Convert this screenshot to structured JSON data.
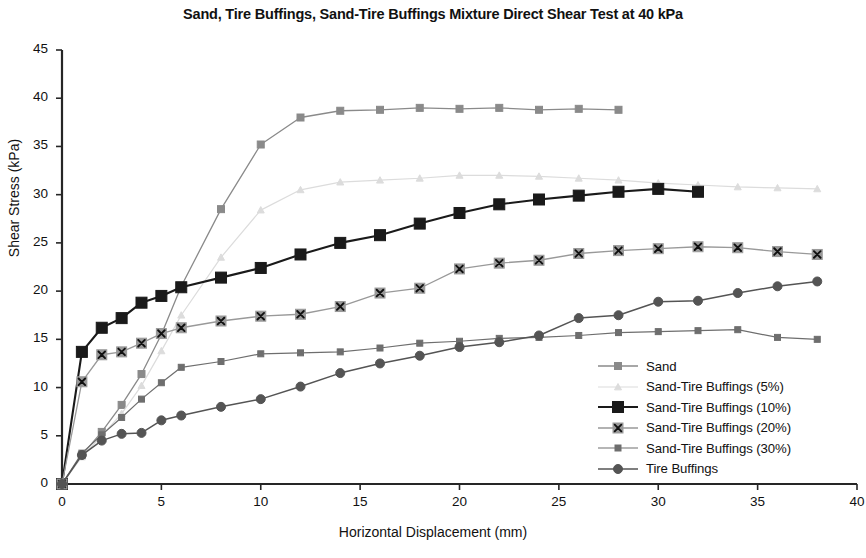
{
  "chart_data": {
    "type": "line",
    "title": "Sand, Tire Buffings, Sand-Tire Buffings Mixture Direct Shear Test at 40 kPa",
    "xlabel": "Horizontal Displacement (mm)",
    "ylabel": "Shear Stress (kPa)",
    "xlim": [
      0,
      40
    ],
    "ylim": [
      0,
      45
    ],
    "xticks": [
      0,
      5,
      10,
      15,
      20,
      25,
      30,
      35,
      40
    ],
    "yticks": [
      0,
      5,
      10,
      15,
      20,
      25,
      30,
      35,
      40,
      45
    ],
    "grid": false,
    "legend_position": "lower-right-inside",
    "series": [
      {
        "name": "Sand",
        "color": "#8a8a8a",
        "marker": "square",
        "marker_size": 7,
        "line_width": 1.3,
        "x": [
          0,
          1,
          2,
          3,
          4,
          5,
          6,
          8,
          10,
          12,
          14,
          16,
          18,
          20,
          22,
          24,
          26,
          28
        ],
        "y": [
          0,
          3.0,
          5.4,
          8.2,
          11.4,
          15.5,
          20.5,
          28.5,
          35.2,
          38.0,
          38.7,
          38.8,
          39.0,
          38.9,
          39.0,
          38.8,
          38.9,
          38.8
        ]
      },
      {
        "name": "Sand-Tire Buffings (5%)",
        "color": "#dcdcdc",
        "marker": "triangle",
        "marker_size": 7,
        "line_width": 1.2,
        "x": [
          0,
          1,
          2,
          3,
          4,
          5,
          6,
          8,
          10,
          12,
          14,
          16,
          18,
          20,
          22,
          24,
          26,
          28,
          30,
          32,
          34,
          36,
          38
        ],
        "y": [
          0,
          2.8,
          5.0,
          7.3,
          10.2,
          13.8,
          17.5,
          23.5,
          28.4,
          30.5,
          31.3,
          31.5,
          31.7,
          32.0,
          32.0,
          31.9,
          31.7,
          31.5,
          31.2,
          31.0,
          30.8,
          30.7,
          30.6
        ]
      },
      {
        "name": "Sand-Tire Buffings (10%)",
        "color": "#1a1a1a",
        "marker": "square",
        "marker_size": 11,
        "line_width": 2.1,
        "x": [
          0,
          1,
          2,
          3,
          4,
          5,
          6,
          8,
          10,
          12,
          14,
          16,
          18,
          20,
          22,
          24,
          26,
          28,
          30,
          32
        ],
        "y": [
          0,
          13.7,
          16.2,
          17.2,
          18.8,
          19.5,
          20.4,
          21.4,
          22.4,
          23.8,
          25.0,
          25.8,
          27.0,
          28.1,
          29.0,
          29.5,
          29.9,
          30.3,
          30.6,
          30.3
        ]
      },
      {
        "name": "Sand-Tire Buffings (20%)",
        "color": "#999999",
        "marker": "x-square",
        "marker_size": 10,
        "line_width": 1.3,
        "x": [
          0,
          1,
          2,
          3,
          4,
          5,
          6,
          8,
          10,
          12,
          14,
          16,
          18,
          20,
          22,
          24,
          26,
          28,
          30,
          32,
          34,
          36,
          38
        ],
        "y": [
          0,
          10.6,
          13.4,
          13.7,
          14.6,
          15.6,
          16.2,
          16.9,
          17.4,
          17.6,
          18.4,
          19.8,
          20.3,
          22.3,
          22.9,
          23.2,
          23.9,
          24.2,
          24.4,
          24.6,
          24.5,
          24.1,
          23.8
        ]
      },
      {
        "name": "Sand-Tire Buffings (30%)",
        "color": "#6e6e6e",
        "marker": "square",
        "marker_size": 6,
        "line_width": 1.2,
        "x": [
          0,
          1,
          2,
          3,
          4,
          5,
          6,
          8,
          10,
          12,
          14,
          16,
          18,
          20,
          22,
          24,
          26,
          28,
          30,
          32,
          34,
          36,
          38
        ],
        "y": [
          0,
          3.2,
          5.1,
          6.9,
          8.8,
          10.5,
          12.1,
          12.7,
          13.5,
          13.6,
          13.7,
          14.1,
          14.6,
          14.8,
          15.1,
          15.2,
          15.4,
          15.7,
          15.8,
          15.9,
          16.0,
          15.2,
          15.0
        ]
      },
      {
        "name": "Tire Buffings",
        "color": "#545454",
        "marker": "circle",
        "marker_size": 9,
        "line_width": 1.5,
        "x": [
          0,
          1,
          2,
          3,
          4,
          5,
          6,
          8,
          10,
          12,
          14,
          16,
          18,
          20,
          22,
          24,
          26,
          28,
          30,
          32,
          34,
          36,
          38
        ],
        "y": [
          0,
          3.0,
          4.5,
          5.2,
          5.3,
          6.6,
          7.1,
          8.0,
          8.8,
          10.1,
          11.5,
          12.5,
          13.3,
          14.2,
          14.7,
          15.4,
          17.2,
          17.5,
          18.9,
          19.0,
          19.8,
          20.5,
          21.0
        ]
      }
    ]
  },
  "legend": {
    "items": [
      "Sand",
      "Sand-Tire Buffings (5%)",
      "Sand-Tire Buffings (10%)",
      "Sand-Tire Buffings (20%)",
      "Sand-Tire Buffings (30%)",
      "Tire Buffings"
    ]
  }
}
